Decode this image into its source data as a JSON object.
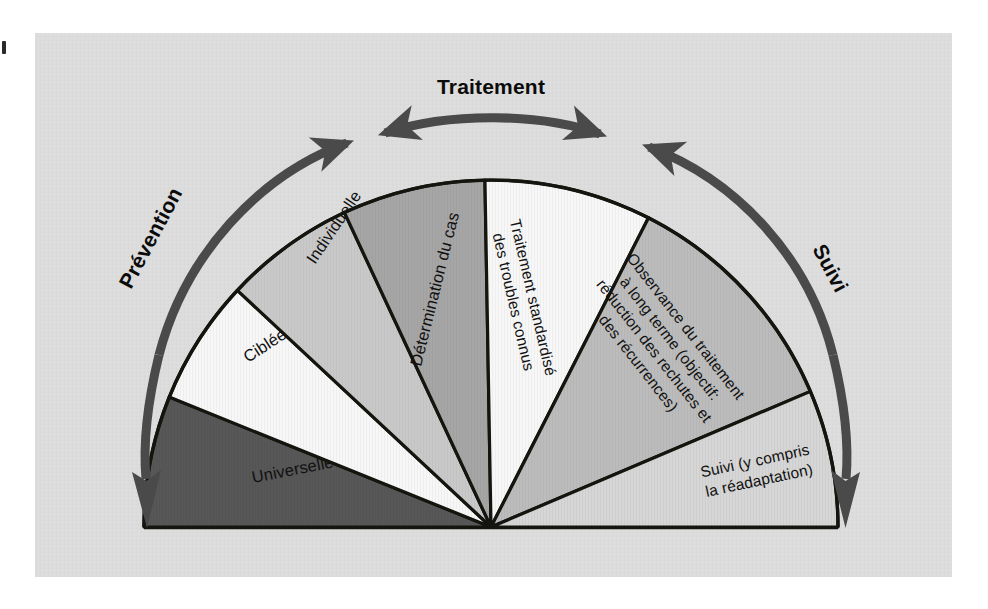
{
  "figure": {
    "title_visible": false,
    "background_color": "#ffffff",
    "panel_color": "#dcdcdc",
    "outline_color": "#15150f"
  },
  "phases": [
    {
      "id": "prevention",
      "label": "Prévention",
      "arrow": "single-arc-arrow-down-left",
      "direction": "downward-left"
    },
    {
      "id": "traitement",
      "label": "Traitement",
      "arrow": "double-headed-arc-arrow",
      "direction": "bidirectional-top"
    },
    {
      "id": "suivi",
      "label": "Suivi",
      "arrow": "single-arc-arrow-down-right",
      "direction": "downward-right"
    }
  ],
  "wheel": {
    "center_x": 491,
    "center_y": 527,
    "radius": 347,
    "sectors": [
      {
        "id": "universelle",
        "label": "Universelle",
        "lines": [
          "Universelle"
        ],
        "fill": "#575757",
        "text_color": "#111111",
        "start_angle": 180,
        "end_angle": 158
      },
      {
        "id": "ciblee",
        "label": "Ciblée",
        "lines": [
          "Ciblée"
        ],
        "fill": "#f7f7f7",
        "text_color": "#111111",
        "start_angle": 158,
        "end_angle": 137
      },
      {
        "id": "individuelle",
        "label": "Individuelle",
        "lines": [
          "Individuelle"
        ],
        "fill": "#c9c9c9",
        "text_color": "#111111",
        "start_angle": 137,
        "end_angle": 115
      },
      {
        "id": "determination-du-cas",
        "label": "Détermination du cas",
        "lines": [
          "Détermination du cas"
        ],
        "fill": "#a6a6a6",
        "text_color": "#111111",
        "start_angle": 115,
        "end_angle": 91
      },
      {
        "id": "traitement-standardise",
        "label": "Traitement standardisé des troubles connus",
        "lines": [
          "Traitement standardisé",
          "des troubles connus"
        ],
        "fill": "#f7f7f7",
        "text_color": "#111111",
        "start_angle": 91,
        "end_angle": 63
      },
      {
        "id": "observance-du-traitement",
        "label": "Observance du traitement à long terme (objectif: réduction des rechutes et des récurrences)",
        "lines": [
          "Observance du traitement",
          "à long terme (objectif:",
          "réduction des rechutes et",
          "des récurrences)"
        ],
        "fill": "#bcbcbc",
        "text_color": "#111111",
        "start_angle": 63,
        "end_angle": 23
      },
      {
        "id": "suivi-readaptation",
        "label": "Suivi (y compris la réadaptation)",
        "lines": [
          "Suivi (y compris",
          "la réadaptation)"
        ],
        "fill": "#d6d6d6",
        "text_color": "#111111",
        "start_angle": 23,
        "end_angle": 0
      }
    ]
  }
}
